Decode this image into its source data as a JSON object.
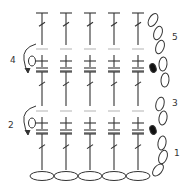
{
  "diagram": {
    "type": "crochet-stitch-chart",
    "columns": 5,
    "column_x": [
      42,
      66,
      90,
      114,
      138
    ],
    "row_labels": [
      {
        "label": "1",
        "x": 174,
        "y": 153
      },
      {
        "label": "2",
        "x": 8,
        "y": 126
      },
      {
        "label": "3",
        "x": 172,
        "y": 105
      },
      {
        "label": "4",
        "x": 10,
        "y": 62
      },
      {
        "label": "5",
        "x": 172,
        "y": 40
      }
    ],
    "rows": [
      {
        "row": 1,
        "stitch": "double-crochet",
        "top_y": 134,
        "bottom_y": 170
      },
      {
        "row": 2,
        "stitch": "single-crochet",
        "center_y": 123
      },
      {
        "row": 3,
        "stitch": "double-crochet",
        "top_y": 72,
        "bottom_y": 106
      },
      {
        "row": 4,
        "stitch": "single-crochet",
        "center_y": 61
      },
      {
        "row": 5,
        "stitch": "double-crochet",
        "top_y": 13,
        "bottom_y": 45
      }
    ],
    "foundation_chain_count": 5,
    "turning_chains": "right-side chain loops with slip stitch markers",
    "colors": {
      "stroke": "#333333",
      "faint_line": "#bbbbbb",
      "slip_stitch": "#111111"
    }
  }
}
